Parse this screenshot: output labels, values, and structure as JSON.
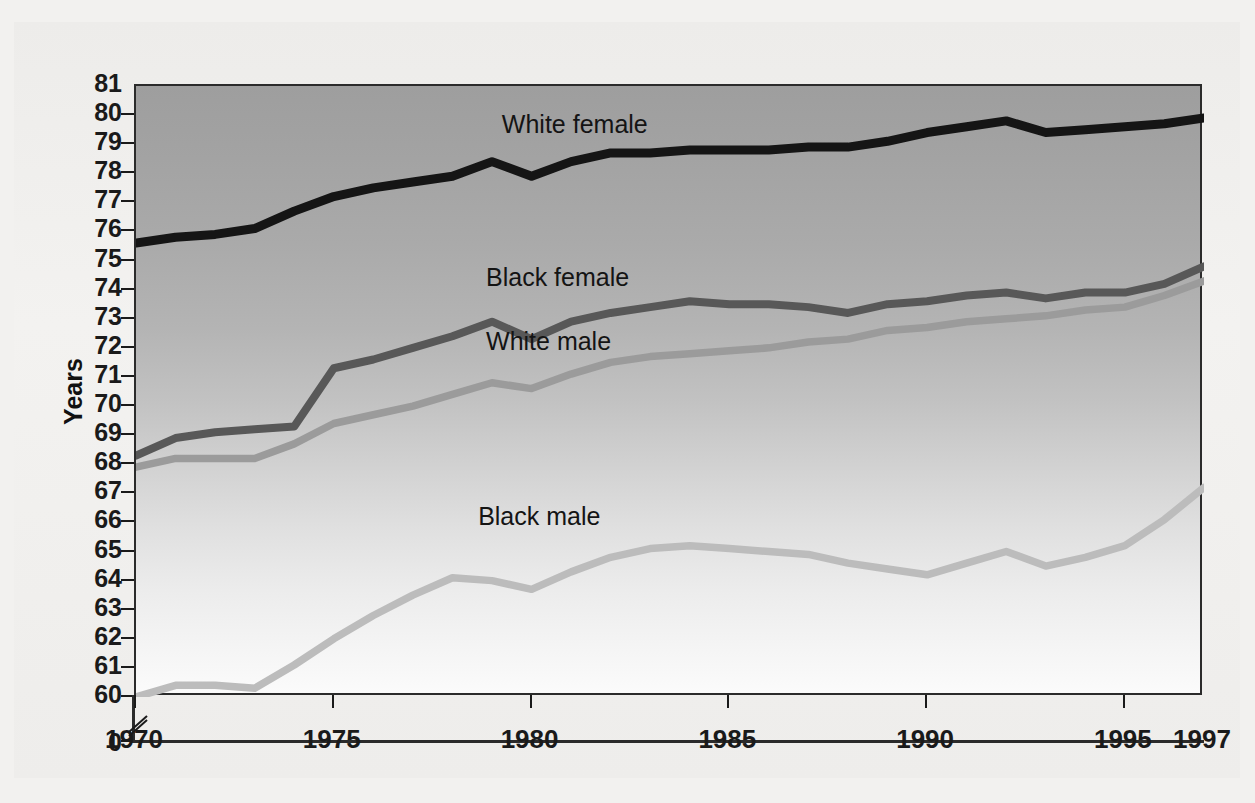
{
  "chart_data": {
    "type": "line",
    "title": "",
    "xlabel": "",
    "ylabel": "Years",
    "x": [
      1970,
      1971,
      1972,
      1973,
      1974,
      1975,
      1976,
      1977,
      1978,
      1979,
      1980,
      1981,
      1982,
      1983,
      1984,
      1985,
      1986,
      1987,
      1988,
      1989,
      1990,
      1991,
      1992,
      1993,
      1994,
      1995,
      1996,
      1997
    ],
    "xlim": [
      1970,
      1997
    ],
    "ylim": [
      60,
      81
    ],
    "y_axis_break_at": 0,
    "xticks": [
      "1970",
      "1975",
      "1980",
      "1985",
      "1990",
      "1995",
      "1997"
    ],
    "yticks": [
      "0",
      "60",
      "61",
      "62",
      "63",
      "64",
      "65",
      "66",
      "67",
      "68",
      "69",
      "70",
      "71",
      "72",
      "73",
      "74",
      "75",
      "76",
      "77",
      "78",
      "79",
      "80",
      "81"
    ],
    "grid": false,
    "legend_position": "inline-labels",
    "series": [
      {
        "name": "White female",
        "color": "#151515",
        "label_x": 1979.3,
        "label_y": 79.55,
        "values": [
          75.6,
          75.8,
          75.9,
          76.1,
          76.7,
          77.2,
          77.5,
          77.7,
          77.9,
          78.4,
          77.9,
          78.4,
          78.7,
          78.7,
          78.8,
          78.8,
          78.8,
          78.9,
          78.9,
          79.1,
          79.4,
          79.6,
          79.8,
          79.4,
          79.5,
          79.6,
          79.7,
          79.9
        ]
      },
      {
        "name": "Black female",
        "color": "#585858",
        "label_x": 1978.9,
        "label_y": 74.3,
        "values": [
          68.3,
          68.9,
          69.1,
          69.2,
          69.3,
          71.3,
          71.6,
          72.0,
          72.4,
          72.9,
          72.3,
          72.9,
          73.2,
          73.4,
          73.6,
          73.5,
          73.5,
          73.4,
          73.2,
          73.5,
          73.6,
          73.8,
          73.9,
          73.7,
          73.9,
          73.9,
          74.2,
          74.8
        ]
      },
      {
        "name": "White male",
        "color": "#9b9b9b",
        "label_x": 1978.9,
        "label_y": 72.1,
        "values": [
          67.9,
          68.2,
          68.2,
          68.2,
          68.7,
          69.4,
          69.7,
          70.0,
          70.4,
          70.8,
          70.6,
          71.1,
          71.5,
          71.7,
          71.8,
          71.9,
          72.0,
          72.2,
          72.3,
          72.6,
          72.7,
          72.9,
          73.0,
          73.1,
          73.3,
          73.4,
          73.8,
          74.3
        ]
      },
      {
        "name": "Black male",
        "color": "#bcbcbc",
        "label_x": 1978.7,
        "label_y": 66.1,
        "values": [
          60.0,
          60.4,
          60.4,
          60.3,
          61.1,
          62.0,
          62.8,
          63.5,
          64.1,
          64.0,
          63.7,
          64.3,
          64.8,
          65.1,
          65.2,
          65.1,
          65.0,
          64.9,
          64.6,
          64.4,
          64.2,
          64.6,
          65.0,
          64.5,
          64.8,
          65.2,
          66.1,
          67.2
        ]
      }
    ]
  },
  "axis": {
    "y_title": "Years",
    "y_tick_labels": [
      "81",
      "80",
      "79",
      "78",
      "77",
      "76",
      "75",
      "74",
      "73",
      "72",
      "71",
      "70",
      "69",
      "68",
      "67",
      "66",
      "65",
      "64",
      "63",
      "62",
      "61",
      "60"
    ],
    "y_zero_label": "0",
    "x_tick_labels": [
      "1970",
      "1975",
      "1980",
      "1985",
      "1990",
      "1995",
      "1997"
    ]
  },
  "series_labels": {
    "white_female": "White female",
    "black_female": "Black female",
    "white_male": "White male",
    "black_male": "Black male"
  }
}
